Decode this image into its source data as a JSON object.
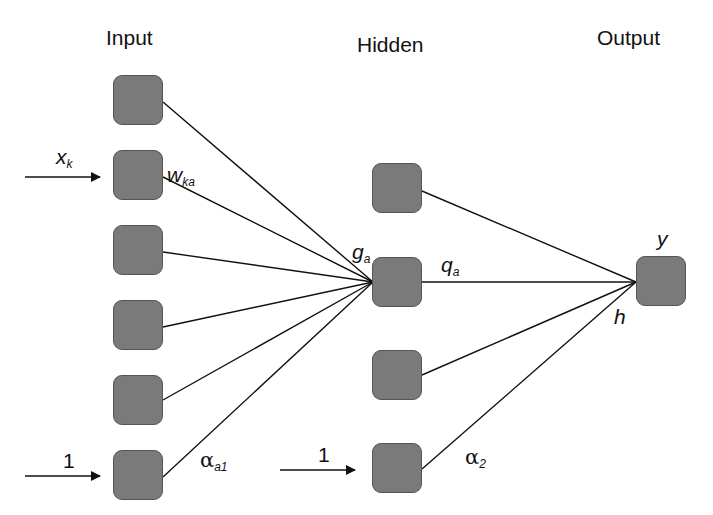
{
  "layers": {
    "input": {
      "title": "Input",
      "node_count": 6
    },
    "hidden": {
      "title": "Hidden",
      "node_count": 4
    },
    "output": {
      "title": "Output",
      "node_count": 1
    }
  },
  "labels": {
    "x_main": "x",
    "x_sub": "k",
    "w_main": "w",
    "w_sub": "ka",
    "g_main": "g",
    "g_sub": "a",
    "q_main": "q",
    "q_sub": "a",
    "y": "y",
    "h": "h",
    "bias_input": "1",
    "bias_hidden": "1",
    "alpha1_main": "α",
    "alpha1_sub": "a1",
    "alpha2_main": "α",
    "alpha2_sub": "2"
  },
  "colors": {
    "node_fill": "#7a7a7a",
    "node_border": "#555555",
    "line": "#111111"
  }
}
